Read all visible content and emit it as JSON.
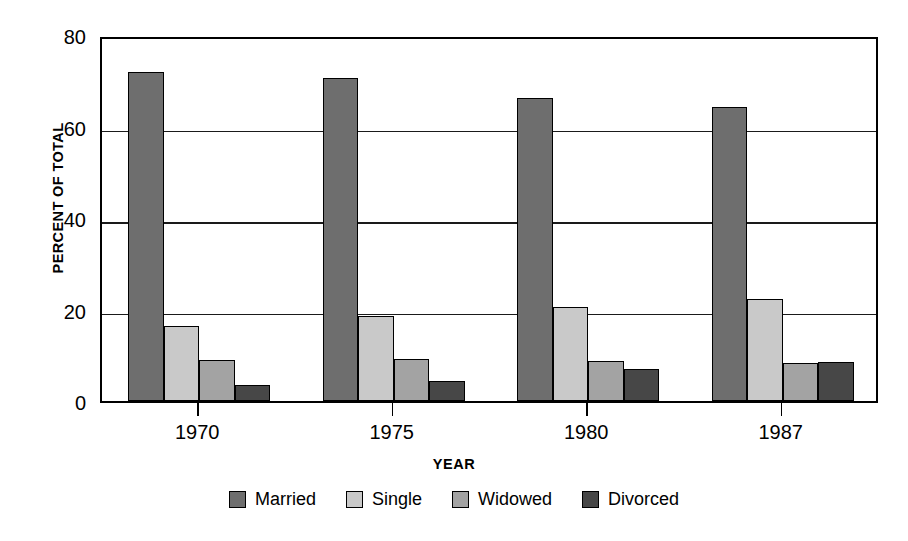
{
  "chart_data": {
    "type": "bar",
    "title": "",
    "xlabel": "YEAR",
    "ylabel": "PERCENT OF TOTAL",
    "categories": [
      "1970",
      "1975",
      "1980",
      "1987"
    ],
    "ylim": [
      0,
      80
    ],
    "yticks": [
      0,
      20,
      40,
      60,
      80
    ],
    "ytick_labels": [
      "0",
      "20",
      "40",
      "60",
      "80"
    ],
    "grid": true,
    "gridlines_at": [
      20,
      40,
      60
    ],
    "legend_position": "bottom",
    "series": [
      {
        "name": "Married",
        "color": "#6e6e6e",
        "values": [
          72.0,
          70.5,
          66.3,
          64.2
        ]
      },
      {
        "name": "Single",
        "color": "#c9c9c9",
        "values": [
          16.5,
          18.5,
          20.6,
          22.3
        ]
      },
      {
        "name": "Widowed",
        "color": "#a3a3a3",
        "values": [
          8.9,
          9.1,
          8.8,
          8.3
        ]
      },
      {
        "name": "Divorced",
        "color": "#474747",
        "values": [
          3.5,
          4.4,
          7.0,
          8.5
        ]
      }
    ]
  },
  "axis": {
    "y_title": "PERCENT OF TOTAL",
    "x_title": "YEAR"
  },
  "legend": {
    "items": [
      {
        "label": "Married",
        "color": "#6e6e6e"
      },
      {
        "label": "Single",
        "color": "#c9c9c9"
      },
      {
        "label": "Widowed",
        "color": "#a3a3a3"
      },
      {
        "label": "Divorced",
        "color": "#474747"
      }
    ]
  },
  "colors": {
    "axis": "#000000",
    "grid": "#1a1a1a",
    "background": "#ffffff"
  }
}
